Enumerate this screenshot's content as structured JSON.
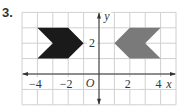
{
  "problem": {
    "number": "3."
  },
  "diagram": {
    "grid": {
      "xmin": -5,
      "xmax": 5,
      "ymin": -2,
      "ymax": 4,
      "line_color": "#d0d0d0"
    },
    "axes": {
      "x_label": "x",
      "y_label": "y",
      "origin_label": "O",
      "x_tick_labels": [
        {
          "value": -4,
          "text": "−4"
        },
        {
          "value": -2,
          "text": "−2"
        },
        {
          "value": 2,
          "text": "2"
        },
        {
          "value": 4,
          "text": "4"
        }
      ],
      "y_tick_labels": [
        {
          "value": 2,
          "text": "2"
        }
      ]
    },
    "shapes": [
      {
        "name": "black-chevron",
        "color": "#1a1a1a",
        "points": [
          [
            -4,
            3
          ],
          [
            -2,
            3
          ],
          [
            -1,
            2
          ],
          [
            -2,
            1
          ],
          [
            -4,
            1
          ],
          [
            -3,
            2
          ]
        ]
      },
      {
        "name": "gray-chevron",
        "color": "#7a7a7a",
        "points": [
          [
            1,
            2
          ],
          [
            2,
            3
          ],
          [
            4,
            3
          ],
          [
            3,
            2
          ],
          [
            4,
            1
          ],
          [
            2,
            1
          ]
        ]
      }
    ]
  }
}
